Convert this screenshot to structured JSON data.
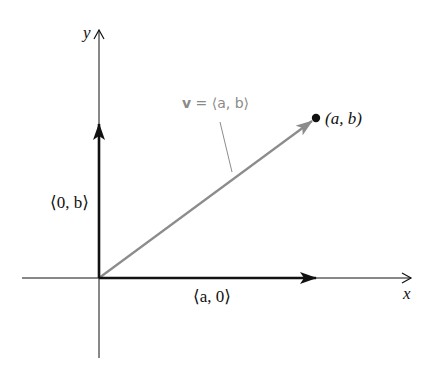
{
  "diagram": {
    "type": "vector-components",
    "axes": {
      "x_label": "x",
      "y_label": "y"
    },
    "vector": {
      "label_bold": "v",
      "label_rest": " = ⟨a, b⟩",
      "color": "#8c8c8c"
    },
    "point": {
      "label": "(a, b)"
    },
    "components": {
      "horizontal_label": "⟨a, 0⟩",
      "vertical_label": "⟨0, b⟩",
      "color": "#111111"
    }
  }
}
